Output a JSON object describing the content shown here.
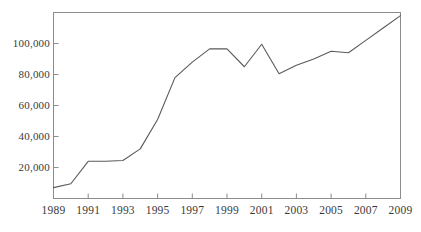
{
  "chart_data": {
    "type": "line",
    "title": "",
    "subtitle": "",
    "xlabel": "",
    "ylabel": "",
    "x": [
      1989,
      1990,
      1991,
      1992,
      1993,
      1994,
      1995,
      1996,
      1997,
      1998,
      1999,
      2000,
      2001,
      2002,
      2003,
      2004,
      2005,
      2006,
      2007,
      2008,
      2009
    ],
    "values": [
      7000,
      9500,
      24000,
      24000,
      24500,
      32000,
      51000,
      78000,
      88000,
      96500,
      96500,
      85000,
      99500,
      80500,
      86000,
      90000,
      95000,
      94000,
      102000,
      110000,
      118000
    ],
    "series": [
      {
        "name": "",
        "values": [
          7000,
          9500,
          24000,
          24000,
          24500,
          32000,
          51000,
          78000,
          88000,
          96500,
          96500,
          85000,
          99500,
          80500,
          86000,
          90000,
          95000,
          94000,
          102000,
          110000,
          118000
        ]
      }
    ],
    "xlim": [
      1989,
      2009
    ],
    "ylim": [
      0,
      120000
    ],
    "grid": false,
    "legend": false,
    "legend_position": "none",
    "line_color": "#5a5a5a",
    "axis_color": "#8c8c8c",
    "background_color": "#ffffff",
    "x_ticks": [
      1989,
      1991,
      1993,
      1995,
      1997,
      1999,
      2001,
      2003,
      2005,
      2007,
      2009
    ],
    "x_tick_labels": [
      "1989",
      "1991",
      "1993",
      "1995",
      "1997",
      "1999",
      "2001",
      "2003",
      "2005",
      "2007",
      "2009"
    ],
    "y_ticks": [
      20000,
      40000,
      60000,
      80000,
      100000
    ],
    "y_tick_labels": [
      "20,000",
      "40,000",
      "60,000",
      "80,000",
      "100,000"
    ],
    "annotations": []
  },
  "axes": {
    "y_tick_labels": [
      "100,000",
      "80,000",
      "60,000",
      "40,000",
      "20,000"
    ],
    "x_tick_labels": [
      "1989",
      "1991",
      "1993",
      "1995",
      "1997",
      "1999",
      "2001",
      "2003",
      "2005",
      "2007",
      "2009"
    ]
  }
}
